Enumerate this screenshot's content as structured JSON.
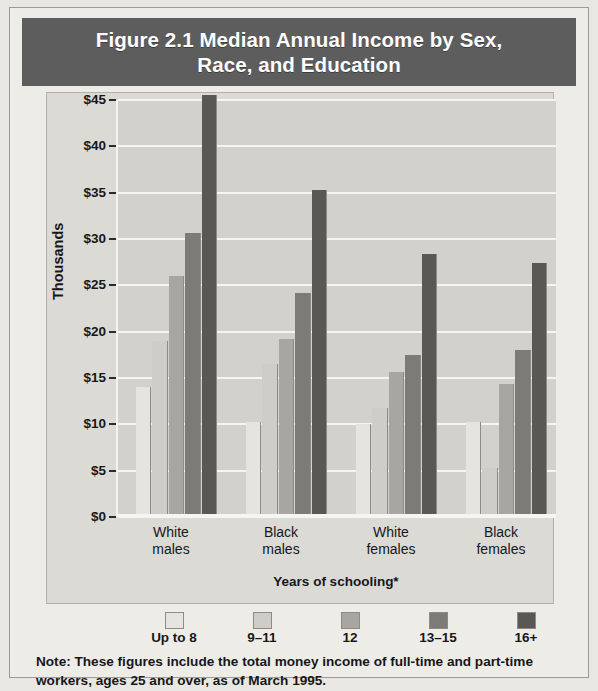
{
  "figure": {
    "title": "Figure 2.1  Median Annual Income by Sex,\nRace, and Education",
    "note": "Note: These figures include the total money income of full-time and part-time workers, ages 25 and over, as of March 1995."
  },
  "colors": {
    "banner_background": "#5d5d5d",
    "banner_text": "#ffffff",
    "plot_background": "#d3d1cc",
    "plate_background": "#dcdad5",
    "page_background": "#eeece7",
    "gridline": "#f6f5f2",
    "axis_text": "#17171a",
    "series": [
      "#e6e4df",
      "#cfcdc8",
      "#a8a6a1",
      "#7d7b77",
      "#5a5855"
    ]
  },
  "chart_data": {
    "type": "bar",
    "title": "Figure 2.1  Median Annual Income by Sex, Race, and Education",
    "xlabel": "Years of schooling*",
    "ylabel": "Thousands",
    "ylim": [
      0,
      45
    ],
    "ytick_labels": [
      "$45",
      "$40",
      "$35",
      "$30",
      "$25",
      "$20",
      "$15",
      "$10",
      "$5",
      "$0"
    ],
    "ytick_values": [
      45,
      40,
      35,
      30,
      25,
      20,
      15,
      10,
      5,
      0
    ],
    "grid": true,
    "legend_position": "bottom",
    "categories": [
      "White\nmales",
      "Black\nmales",
      "White\nfemales",
      "Black\nfemales"
    ],
    "category_labels_flat": [
      "White males",
      "Black males",
      "White females",
      "Black females"
    ],
    "series": [
      {
        "name": "Up to 8",
        "color": "#e6e4df",
        "values": [
          14.0,
          10.2,
          10.0,
          10.2
        ]
      },
      {
        "name": "9–11",
        "color": "#cfcdc8",
        "values": [
          19.0,
          16.5,
          11.8,
          5.3
        ]
      },
      {
        "name": "12",
        "color": "#a8a6a1",
        "values": [
          26.0,
          19.2,
          15.6,
          14.4
        ]
      },
      {
        "name": "13–15",
        "color": "#7d7b77",
        "values": [
          30.7,
          24.2,
          17.5,
          18.0
        ]
      },
      {
        "name": "16+",
        "color": "#5a5855",
        "values": [
          45.5,
          35.3,
          28.4,
          27.4
        ]
      }
    ]
  }
}
